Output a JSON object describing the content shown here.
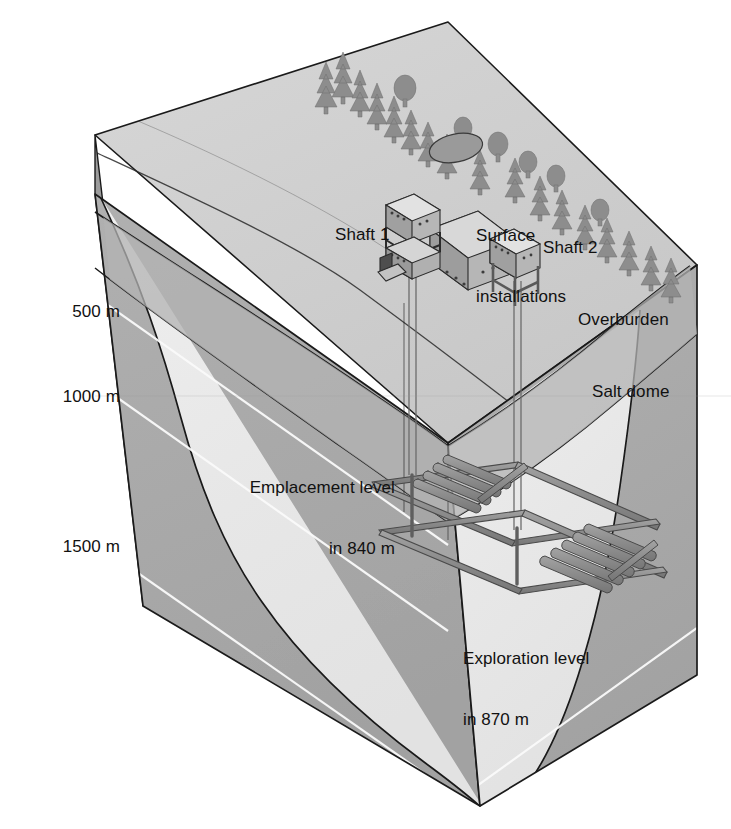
{
  "diagram": {
    "type": "geological-block-diagram",
    "background_color": "#ffffff"
  },
  "depth_scale": {
    "unit": "m",
    "ticks": [
      {
        "label": "500 m",
        "depth": 500
      },
      {
        "label": "1000 m",
        "depth": 1000
      },
      {
        "label": "1500 m",
        "depth": 1500
      }
    ]
  },
  "geology": {
    "layers": [
      {
        "name": "Overburden",
        "label": "Overburden",
        "color": "#a9a9a9"
      },
      {
        "name": "Salt dome",
        "label": "Salt dome",
        "color": "#eaeaea"
      }
    ],
    "surface_color": "#cfcfcf",
    "left_face_color": "#a9a9a9",
    "outline_color": "#1a1a1a"
  },
  "surface": {
    "installations_label": "Surface\ninstallations",
    "installations_label_line1": "Surface",
    "installations_label_line2": "installations",
    "shaft1_label": "Shaft 1",
    "shaft2_label": "Shaft 2",
    "vegetation": "conifer-forest-ridge",
    "pond": "small-pond"
  },
  "mine": {
    "emplacement": {
      "label_line1": "Emplacement level",
      "label_line2": "in 840 m",
      "depth_m": 840
    },
    "exploration": {
      "label_line1": "Exploration level",
      "label_line2": "in 870 m",
      "depth_m": 870
    },
    "tunnel_color": "#8a8a8a",
    "tunnel_outline": "#4a4a4a"
  },
  "colors": {
    "ink": "#1a1a1a",
    "salt": "#eaeaea",
    "overburden": "#a9a9a9",
    "top_surface": "#cfcfcf",
    "strata_line": "#f5f5f5",
    "tunnel": "#8c8c8c"
  }
}
